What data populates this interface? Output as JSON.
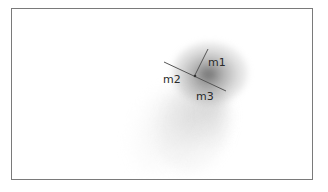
{
  "figure": {
    "frame_color": "#7a7a7a",
    "line_color": "#555555",
    "labels": [
      {
        "id": "m1",
        "text": "m1"
      },
      {
        "id": "m2",
        "text": "m2"
      },
      {
        "id": "m3",
        "text": "m3"
      }
    ],
    "lines": [
      {
        "name": "m1-line",
        "x1": 208,
        "y1": 49,
        "x2": 195,
        "y2": 75
      },
      {
        "name": "m2-m3-line",
        "x1": 164,
        "y1": 62,
        "x2": 226,
        "y2": 91
      }
    ]
  }
}
